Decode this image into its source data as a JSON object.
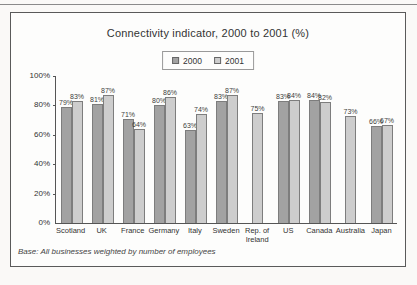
{
  "chart_data": {
    "type": "bar",
    "title": "Connectivity indicator, 2000 to 2001 (%)",
    "categories": [
      "Scotland",
      "UK",
      "France",
      "Germany",
      "Italy",
      "Sweden",
      "Rep. of Ireland",
      "US",
      "Canada",
      "Australia",
      "Japan"
    ],
    "series": [
      {
        "name": "2000",
        "color": "#a2a2a2",
        "values": [
          79,
          81,
          71,
          80,
          63,
          83,
          null,
          83,
          84,
          null,
          66
        ]
      },
      {
        "name": "2001",
        "color": "#cdcdcd",
        "values": [
          83,
          87,
          64,
          86,
          74,
          87,
          75,
          84,
          82,
          73,
          67
        ]
      }
    ],
    "value_label_suffix": "%",
    "xlabel": "",
    "ylabel": "",
    "ylim": [
      0,
      100
    ],
    "yticks": [
      0,
      20,
      40,
      60,
      80,
      100
    ],
    "ytick_suffix": "%",
    "grid": false,
    "legend_position": "top-center",
    "value_labels": true,
    "base_note": "Base: All businesses weighted by number of employees"
  }
}
